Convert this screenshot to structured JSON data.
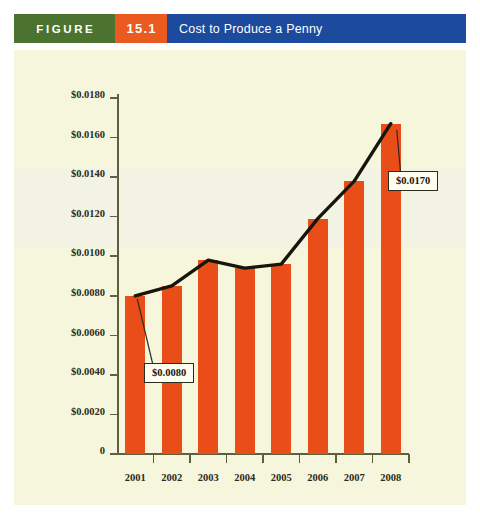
{
  "banner": {
    "figure_label": "FIGURE",
    "figure_number": "15.1",
    "title": "Cost to Produce a Penny",
    "colors": {
      "figure_bg": "#4c7230",
      "number_bg": "#eb5a1e",
      "title_bg": "#1c4a9c",
      "text": "#ffffff"
    }
  },
  "panel": {
    "background": "#f6f6dc",
    "band_background": "#f2f3e2"
  },
  "chart_data": {
    "type": "bar",
    "title": "Cost to Produce a Penny",
    "xlabel": "",
    "ylabel": "",
    "categories": [
      "2001",
      "2002",
      "2003",
      "2004",
      "2005",
      "2006",
      "2007",
      "2008"
    ],
    "values": [
      0.008,
      0.0085,
      0.0098,
      0.0094,
      0.0096,
      0.0119,
      0.0138,
      0.0167
    ],
    "series": [
      {
        "name": "Cost to produce a penny (bars)",
        "type": "bar",
        "values": [
          0.008,
          0.0085,
          0.0098,
          0.0094,
          0.0096,
          0.0119,
          0.0138,
          0.0167
        ]
      },
      {
        "name": "Trend line",
        "type": "line",
        "values": [
          0.008,
          0.0085,
          0.0098,
          0.0094,
          0.0096,
          0.0119,
          0.0138,
          0.0167
        ]
      }
    ],
    "ylim": [
      0,
      0.018
    ],
    "ytick_values": [
      0,
      0.002,
      0.004,
      0.006,
      0.008,
      0.01,
      0.012,
      0.014,
      0.016,
      0.018
    ],
    "ytick_labels": [
      "0",
      "$0.0020",
      "$0.0040",
      "$0.0060",
      "$0.0080",
      "$0.0100",
      "$0.0120",
      "$0.0140",
      "$0.0160",
      "$0.0180"
    ],
    "grid": false,
    "legend": null,
    "bar_color": "#ea4e18",
    "line_color": "#16160d",
    "annotations": [
      {
        "id": "low",
        "label": "$0.0080",
        "x": "2001",
        "y": 0.008
      },
      {
        "id": "high",
        "label": "$0.0170",
        "x": "2008",
        "y": 0.0167
      }
    ]
  }
}
